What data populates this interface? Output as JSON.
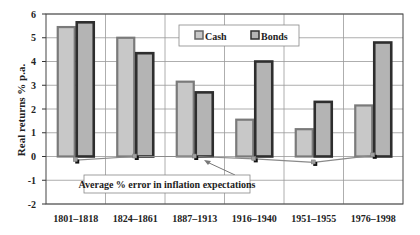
{
  "chart_data": {
    "type": "bar",
    "title": "",
    "xlabel": "",
    "ylabel": "Real returns % p.a.",
    "ylim": [
      -2,
      6
    ],
    "yticks": [
      -2,
      -1,
      0,
      1,
      2,
      3,
      4,
      5,
      6
    ],
    "grid": true,
    "legend_position": "top-center-right (inside plot)",
    "categories": [
      "1801–1818",
      "1824–1861",
      "1887–1913",
      "1916–1940",
      "1951–1955",
      "1976–1998"
    ],
    "series": [
      {
        "name": "Cash",
        "type": "bar",
        "color": "#c8c8c8",
        "edge": "#7a7a7a",
        "values": [
          5.45,
          5.0,
          3.15,
          1.55,
          1.15,
          2.15
        ]
      },
      {
        "name": "Bonds",
        "type": "bar",
        "color": "#b4b4b4",
        "edge": "#2e2e2e",
        "values": [
          5.65,
          4.35,
          2.7,
          4.0,
          2.3,
          4.8
        ]
      },
      {
        "name": "Average % error in inflation expectations",
        "type": "line",
        "color": "#8a8a8a",
        "values": [
          -0.15,
          0.0,
          0.0,
          -0.1,
          -0.25,
          0.05
        ]
      }
    ],
    "annotations": [
      {
        "text": "Average % error in inflation expectations",
        "arrow_to": "1887–1913 / 1916–1940 error line"
      }
    ]
  },
  "legend": {
    "cash": "Cash",
    "bonds": "Bonds"
  },
  "annotation": {
    "text": "Average % error in inflation expectations"
  },
  "axis": {
    "ylabel": "Real returns % p.a."
  }
}
